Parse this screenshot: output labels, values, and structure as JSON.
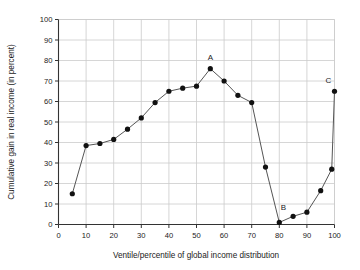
{
  "chart_data": {
    "type": "line",
    "title": "",
    "subtitle": "",
    "xlabel": "Ventile/percentile of global income distribution",
    "ylabel": "Cumulative gain in real income (in percent)",
    "xlim": [
      0,
      100
    ],
    "ylim": [
      0,
      100
    ],
    "xticks": [
      0,
      10,
      20,
      30,
      40,
      50,
      60,
      70,
      80,
      90,
      100
    ],
    "yticks": [
      0,
      10,
      20,
      30,
      40,
      50,
      60,
      70,
      80,
      90,
      100
    ],
    "xtick_labels": [
      "0",
      "10",
      "20",
      "30",
      "40",
      "50",
      "60",
      "70",
      "80",
      "90",
      "100"
    ],
    "ytick_labels": [
      "0",
      "10",
      "20",
      "30",
      "40",
      "50",
      "60",
      "70",
      "80",
      "90",
      "100"
    ],
    "grid": true,
    "legend": false,
    "legend_position": "none",
    "marker": "circle-filled",
    "marker_color": "#111111",
    "line_color": "#555555",
    "grid_color": "#cccccc",
    "axis_color": "#444444",
    "background_color": "#ffffff",
    "x": [
      5,
      10,
      15,
      20,
      25,
      30,
      35,
      40,
      45,
      50,
      55,
      60,
      65,
      70,
      75,
      80,
      85,
      90,
      95,
      99,
      100
    ],
    "values": [
      15,
      38.5,
      39.5,
      41.5,
      46.5,
      52,
      59.5,
      65,
      66.5,
      67.5,
      76,
      70,
      63,
      59.5,
      28,
      1,
      4,
      6,
      16.5,
      27,
      65
    ],
    "series": [
      {
        "name": "Cumulative gain in real income",
        "values": [
          15,
          38.5,
          39.5,
          41.5,
          46.5,
          52,
          59.5,
          65,
          66.5,
          67.5,
          76,
          70,
          63,
          59.5,
          28,
          1,
          4,
          6,
          16.5,
          27,
          65
        ]
      }
    ],
    "annotations": [
      {
        "text": "A",
        "x": 55,
        "y": 76,
        "dx": 0,
        "dy": -9,
        "description": "peak of the elephant curve"
      },
      {
        "text": "B",
        "x": 80,
        "y": 1,
        "dx": 4,
        "dy": -12,
        "description": "trough of the elephant curve"
      },
      {
        "text": "C",
        "x": 100,
        "y": 65,
        "dx": -6,
        "dy": -8,
        "description": "top-percentile upswing"
      }
    ]
  }
}
